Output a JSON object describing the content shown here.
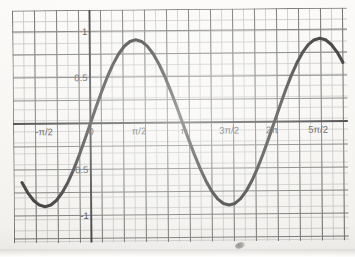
{
  "image": {
    "kind": "scanned-graph-paper",
    "paper_color": "#f7f6f4",
    "minor_grid_color": "#b9b9b7",
    "major_grid_color": "#6e6e6c",
    "axis_color": "#2e2e2e",
    "curve_color": "#2b2b2b",
    "label_color": "#3b3b3b"
  },
  "chart_data": {
    "type": "line",
    "title": "",
    "subtitle": "",
    "xlabel": "",
    "ylabel": "",
    "function": "y = sin(x)",
    "grid": true,
    "legend": "none",
    "xlim": [
      -2.356194490192345,
      8.63937979737193
    ],
    "ylim": [
      -1.35,
      1.35
    ],
    "x_tick_labels": [
      "-π/2",
      "0",
      "π/2",
      "π",
      "3π/2",
      "2π",
      "5π/2"
    ],
    "x_tick_values": [
      -1.5707963,
      0,
      1.5707963,
      3.1415927,
      4.712389,
      6.2831853,
      7.8539816
    ],
    "y_tick_labels": [
      "1",
      "0.5",
      "-0.5",
      "-1"
    ],
    "y_tick_values": [
      1,
      0.5,
      -0.5,
      -1
    ],
    "annotations": [],
    "key_points": [
      {
        "label": "minimum",
        "x": -1.5707963,
        "y": -1
      },
      {
        "label": "zero-crossing",
        "x": 0,
        "y": 0
      },
      {
        "label": "maximum",
        "x": 1.5707963,
        "y": 1
      },
      {
        "label": "zero-crossing",
        "x": 3.1415927,
        "y": 0
      },
      {
        "label": "minimum",
        "x": 4.712389,
        "y": -1
      },
      {
        "label": "zero-crossing",
        "x": 6.2831853,
        "y": 0
      },
      {
        "label": "maximum",
        "x": 7.8539816,
        "y": 1
      }
    ],
    "series": [
      {
        "name": "y = sin(x)",
        "x": [
          -2.3562,
          -2.1598,
          -1.9635,
          -1.7671,
          -1.5708,
          -1.3744,
          -1.1781,
          -0.9817,
          -0.7854,
          -0.589,
          -0.3927,
          -0.1963,
          0,
          0.1963,
          0.3927,
          0.589,
          0.7854,
          0.9817,
          1.1781,
          1.3744,
          1.5708,
          1.7671,
          1.9635,
          2.1598,
          2.3562,
          2.5525,
          2.7489,
          2.9452,
          3.1416,
          3.3379,
          3.5343,
          3.7306,
          3.927,
          4.1233,
          4.3197,
          4.516,
          4.7124,
          4.9087,
          5.1051,
          5.3014,
          5.4978,
          5.6941,
          5.8905,
          6.0868,
          6.2832,
          6.4795,
          6.6759,
          6.8722,
          7.0686,
          7.2649,
          7.4613,
          7.6576,
          7.854,
          8.0503,
          8.2467,
          8.443,
          8.6394
        ],
        "y": [
          -0.7071,
          -0.8315,
          -0.9239,
          -0.9808,
          -1,
          -0.9808,
          -0.9239,
          -0.8315,
          -0.7071,
          -0.5556,
          -0.3827,
          -0.1951,
          0,
          0.1951,
          0.3827,
          0.5556,
          0.7071,
          0.8315,
          0.9239,
          0.9808,
          1,
          0.9808,
          0.9239,
          0.8315,
          0.7071,
          0.5556,
          0.3827,
          0.1951,
          0,
          -0.1951,
          -0.3827,
          -0.5556,
          -0.7071,
          -0.8315,
          -0.9239,
          -0.9808,
          -1,
          -0.9808,
          -0.9239,
          -0.8315,
          -0.7071,
          -0.5556,
          -0.3827,
          -0.1951,
          0,
          0.1951,
          0.3827,
          0.5556,
          0.7071,
          0.8315,
          0.9239,
          0.9808,
          1,
          0.9808,
          0.9239,
          0.8315,
          0.7071
        ]
      }
    ]
  },
  "x_labels": [
    {
      "text": "-π/2",
      "left": 44,
      "top": 126
    },
    {
      "text": "0",
      "left": 91,
      "top": 126
    },
    {
      "text": "π/2",
      "left": 139,
      "top": 126
    },
    {
      "text": "π",
      "left": 184,
      "top": 126
    },
    {
      "text": "3π/2",
      "left": 229,
      "top": 126
    },
    {
      "text": "2π",
      "left": 272,
      "top": 126
    },
    {
      "text": "5π/2",
      "left": 318,
      "top": 126
    }
  ],
  "y_labels": [
    {
      "text": "1",
      "left": 88,
      "top": 31
    },
    {
      "text": "0.5",
      "left": 88,
      "top": 77
    },
    {
      "text": "-0.5",
      "left": 88,
      "top": 169
    },
    {
      "text": "-1",
      "left": 88,
      "top": 215
    }
  ]
}
